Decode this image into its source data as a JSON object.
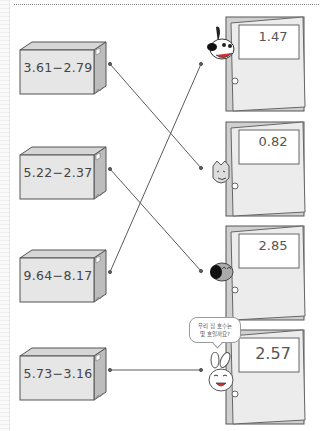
{
  "worksheet": {
    "instruction_type": "match-by-line",
    "colors": {
      "line": "#555555",
      "box_fill": "#e4e4e4",
      "door_fill": "#e8e8e8",
      "door_frame": "#6b6b6b"
    }
  },
  "boxes": [
    {
      "expression": "3.61−2.79"
    },
    {
      "expression": "5.22−2.37"
    },
    {
      "expression": "9.64−8.17"
    },
    {
      "expression": "5.73−3.16"
    }
  ],
  "doors": [
    {
      "number": "1.47",
      "character": "dog"
    },
    {
      "number": "0.82",
      "character": "cat"
    },
    {
      "number": "2.85",
      "character": "bird"
    },
    {
      "number": "2.57",
      "character": "rabbit"
    }
  ],
  "speech_bubble": {
    "line1": "우리 집 호수는",
    "line2": "몇 호일까요?"
  },
  "connections": [
    {
      "from_box": 1,
      "to_door": 2
    },
    {
      "from_box": 2,
      "to_door": 3
    },
    {
      "from_box": 3,
      "to_door": 1
    },
    {
      "from_box": 4,
      "to_door": 4
    }
  ]
}
